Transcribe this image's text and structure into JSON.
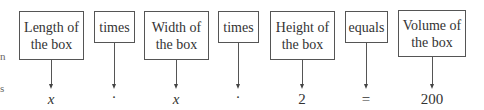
{
  "left_fragments": [
    "n",
    "s"
  ],
  "columns": [
    {
      "id": "length",
      "label_line1": "Length of",
      "label_line2": "the box",
      "value": "x",
      "italic": true
    },
    {
      "id": "times1",
      "label_line1": "times",
      "label_line2": "",
      "value": "·",
      "italic": false
    },
    {
      "id": "width",
      "label_line1": "Width of",
      "label_line2": "the box",
      "value": "x",
      "italic": true
    },
    {
      "id": "times2",
      "label_line1": "times",
      "label_line2": "",
      "value": "·",
      "italic": false
    },
    {
      "id": "height",
      "label_line1": "Height of",
      "label_line2": "the box",
      "value": "2",
      "italic": false
    },
    {
      "id": "equals",
      "label_line1": "equals",
      "label_line2": "",
      "value": "=",
      "italic": false
    },
    {
      "id": "volume",
      "label_line1": "Volume of",
      "label_line2": "the box",
      "value": "200",
      "italic": false
    }
  ]
}
